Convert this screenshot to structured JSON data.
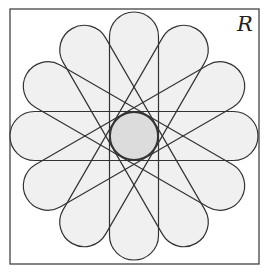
{
  "diagram": {
    "type": "geometric-rosette",
    "region_label": "R",
    "frame": {
      "x": 10,
      "y": 9,
      "width": 249,
      "height": 255
    },
    "center": {
      "x": 134,
      "y": 136
    },
    "petals": {
      "count": 6,
      "shape": "stadium",
      "half_length": 124,
      "half_width": 24.5,
      "angles_deg": [
        0,
        30,
        60,
        90,
        120,
        150
      ]
    },
    "center_circle": {
      "radius": 24
    },
    "colors": {
      "stroke": "#333333",
      "petal_fill": "#f0f0f0",
      "center_fill": "#dcdcdc",
      "frame_stroke": "#444444",
      "background": "#ffffff"
    }
  }
}
